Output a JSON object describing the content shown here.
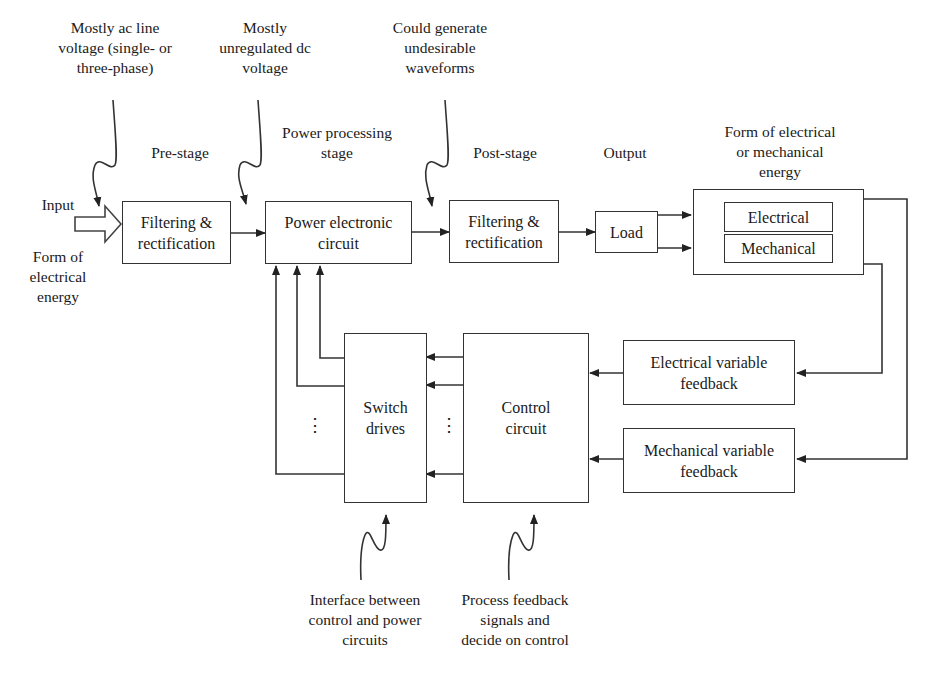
{
  "annotations": {
    "ac_line_voltage": [
      "Mostly ac line",
      "voltage (single- or",
      "three-phase)"
    ],
    "unregulated_dc": [
      "Mostly",
      "unregulated dc",
      "voltage"
    ],
    "undesirable_waveforms": [
      "Could generate",
      "undesirable",
      "waveforms"
    ],
    "interface": [
      "Interface between",
      "control and power",
      "circuits"
    ],
    "process_feedback": [
      "Process feedback",
      "signals and",
      "decide on control"
    ]
  },
  "stage_labels": {
    "pre_stage": "Pre-stage",
    "power_processing": [
      "Power processing",
      "stage"
    ],
    "post_stage": "Post-stage",
    "output": "Output",
    "output_form": [
      "Form of electrical",
      "or mechanical",
      "energy"
    ]
  },
  "input": {
    "label": "Input",
    "form": [
      "Form of",
      "electrical",
      "energy"
    ]
  },
  "blocks": {
    "pre_filter": [
      "Filtering &",
      "rectification"
    ],
    "power_circuit": [
      "Power electronic",
      "circuit"
    ],
    "post_filter": [
      "Filtering &",
      "rectification"
    ],
    "load": "Load",
    "energy_electrical": "Electrical",
    "energy_mechanical": "Mechanical",
    "switch_drives": [
      "Switch",
      "drives"
    ],
    "control_circuit": [
      "Control",
      "circuit"
    ],
    "electrical_feedback": [
      "Electrical variable",
      "feedback"
    ],
    "mechanical_feedback": [
      "Mechanical variable",
      "feedback"
    ]
  },
  "ellipsis": "⋮",
  "colors": {
    "line": "#333333",
    "text": "#1a1a1a",
    "background": "#ffffff"
  }
}
